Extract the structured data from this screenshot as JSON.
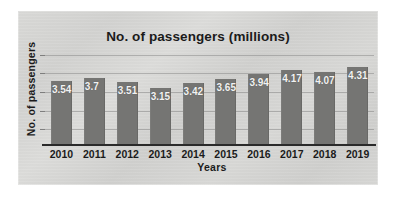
{
  "chart_data": {
    "type": "bar",
    "title": "No. of passengers (millions)",
    "xlabel": "Years",
    "ylabel": "No. of passengers",
    "categories": [
      "2010",
      "2011",
      "2012",
      "2013",
      "2014",
      "2015",
      "2016",
      "2017",
      "2018",
      "2019"
    ],
    "values": [
      3.54,
      3.7,
      3.51,
      3.15,
      3.42,
      3.65,
      3.94,
      4.17,
      4.07,
      4.31
    ],
    "value_labels": [
      "3.54",
      "3.7",
      "3.51",
      "3.15",
      "3.42",
      "3.65",
      "3.94",
      "4.17",
      "4.07",
      "4.31"
    ],
    "ylim": [
      0,
      5
    ],
    "grid": true,
    "legend": false,
    "bar_color": "#757573",
    "label_color": "#f2f2f2",
    "axis_color": "#2a2a2a",
    "panel_color": "#d6d6d4"
  }
}
